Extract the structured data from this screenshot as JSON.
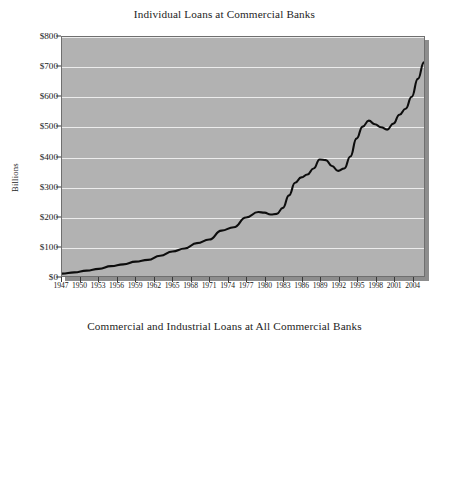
{
  "document": {
    "figure_count": 2
  },
  "chart_data": [
    {
      "type": "line",
      "title": "Individual Loans at Commercial Banks",
      "xlabel": "",
      "ylabel": "Billions",
      "ylim": [
        0,
        800
      ],
      "xlim": [
        1947,
        2006
      ],
      "grid": true,
      "legend": "none",
      "y_ticks": [
        "$0",
        "$100",
        "$200",
        "$300",
        "$400",
        "$500",
        "$600",
        "$700",
        "$800"
      ],
      "y_tick_values": [
        0,
        100,
        200,
        300,
        400,
        500,
        600,
        700,
        800
      ],
      "x_ticks": [
        "1947",
        "1950",
        "1953",
        "1956",
        "1959",
        "1962",
        "1965",
        "1968",
        "1971",
        "1974",
        "1977",
        "1980",
        "1983",
        "1986",
        "1989",
        "1992",
        "1995",
        "1998",
        "2001",
        "2004"
      ],
      "x_tick_values": [
        1947,
        1950,
        1953,
        1956,
        1959,
        1962,
        1965,
        1968,
        1971,
        1974,
        1977,
        1980,
        1983,
        1986,
        1989,
        1992,
        1995,
        1998,
        2001,
        2004
      ],
      "series": [
        {
          "name": "Individual Loans",
          "x": [
            1947,
            1949,
            1951,
            1953,
            1955,
            1957,
            1959,
            1961,
            1963,
            1965,
            1967,
            1969,
            1971,
            1973,
            1975,
            1977,
            1979,
            1980,
            1981,
            1982,
            1983,
            1984,
            1985,
            1986,
            1987,
            1988,
            1989,
            1990,
            1991,
            1992,
            1993,
            1994,
            1995,
            1996,
            1997,
            1998,
            1999,
            2000,
            2001,
            2002,
            2003,
            2004,
            2005,
            2006
          ],
          "values": [
            8,
            12,
            18,
            24,
            33,
            39,
            48,
            54,
            68,
            82,
            92,
            110,
            122,
            152,
            163,
            196,
            214,
            212,
            206,
            208,
            228,
            270,
            312,
            330,
            340,
            360,
            390,
            388,
            368,
            352,
            360,
            400,
            460,
            500,
            520,
            508,
            498,
            490,
            510,
            540,
            560,
            600,
            660,
            715
          ]
        }
      ]
    },
    {
      "type": "line",
      "title": "Commercial and Industrial Loans at All Commercial Banks",
      "xlabel": "",
      "ylabel": "Billions",
      "ylim": [
        0,
        1200
      ],
      "xlim": [
        1947,
        2006
      ],
      "grid": true,
      "legend": "none",
      "y_ticks": [
        "$600",
        "$800",
        "$1,000",
        "$1,200"
      ],
      "y_tick_values": [
        600,
        800,
        1000,
        1200
      ],
      "x_ticks": [],
      "series": [
        {
          "name": "Commercial and Industrial Loans",
          "x": [
            1947,
            1952,
            1957,
            1962,
            1967,
            1971,
            1974,
            1977,
            1980,
            1982,
            1984,
            1986,
            1988,
            1989,
            1990,
            1991,
            1992,
            1993,
            1994,
            1995,
            1996,
            1997,
            1998,
            1999,
            2000,
            2001,
            2002,
            2003,
            2004,
            2005,
            2006
          ],
          "values": [
            18,
            28,
            42,
            58,
            88,
            120,
            175,
            205,
            300,
            380,
            450,
            500,
            560,
            600,
            640,
            645,
            620,
            600,
            615,
            680,
            740,
            800,
            880,
            940,
            1020,
            1100,
            1040,
            960,
            900,
            940,
            1010
          ]
        }
      ]
    }
  ]
}
